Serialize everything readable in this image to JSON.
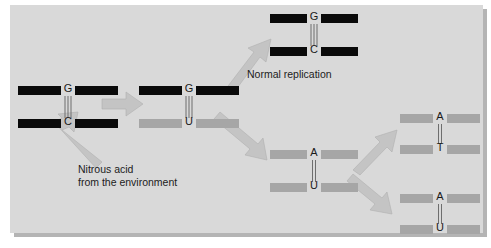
{
  "figure": {
    "background_color": "#ffffff",
    "panel_color": "#d9d9d9",
    "strand_dark_color": "#0a0a0a",
    "strand_light_color": "#a6a6a6",
    "arrow_color": "#c4c4c4"
  },
  "labels": {
    "normal_replication": "Normal replication",
    "nitrous_acid_line1": "Nitrous acid",
    "nitrous_acid_line2": "from the environment"
  },
  "base_pairs": [
    {
      "id": "original-gc",
      "top_base": "G",
      "bottom_base": "C",
      "top_strand_color": "dark",
      "bottom_strand_color": "dark",
      "bonds": 3
    },
    {
      "id": "mutated-gu",
      "top_base": "G",
      "bottom_base": "U",
      "top_strand_color": "dark",
      "bottom_strand_color": "light",
      "bonds": 3
    },
    {
      "id": "replicated-gc",
      "top_base": "G",
      "bottom_base": "C",
      "top_strand_color": "dark",
      "bottom_strand_color": "dark",
      "bonds": 3
    },
    {
      "id": "intermediate-au",
      "top_base": "A",
      "bottom_base": "U",
      "top_strand_color": "light",
      "bottom_strand_color": "light",
      "bonds": 2
    },
    {
      "id": "product-at",
      "top_base": "A",
      "bottom_base": "T",
      "top_strand_color": "light",
      "bottom_strand_color": "light",
      "bonds": 2
    },
    {
      "id": "product-au",
      "top_base": "A",
      "bottom_base": "U",
      "top_strand_color": "light",
      "bottom_strand_color": "light",
      "bonds": 2
    }
  ],
  "arrows": [
    {
      "id": "arrow-deamination",
      "direction": "right"
    },
    {
      "id": "arrow-normal-replication",
      "direction": "up-right"
    },
    {
      "id": "arrow-mutant-replication",
      "direction": "down-right"
    },
    {
      "id": "arrow-nitrous-acid",
      "direction": "up-left"
    },
    {
      "id": "arrow-to-at",
      "direction": "up-right"
    },
    {
      "id": "arrow-to-au",
      "direction": "down-right"
    }
  ]
}
